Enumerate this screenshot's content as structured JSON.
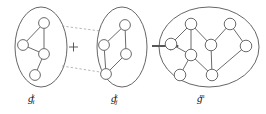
{
  "figure": {
    "type": "diagram",
    "background_color": "#ffffff",
    "node_fill": "#ffffff",
    "node_stroke": "#6b6b6b",
    "edge_color": "#6b6b6b",
    "ellipse_stroke": "#555555",
    "dashed_line_color": "#9a9a9a",
    "arrow_color": "#1f1f1f",
    "operator_symbol": "+",
    "arrow_symbol": "→"
  },
  "panels": [
    {
      "id": "left",
      "name": "graph-fragment-i",
      "label": {
        "base": "g",
        "sub": "i",
        "sup": "k",
        "text": "g_i^k"
      },
      "ellipse": {
        "cx": 41,
        "cy": 47,
        "rx": 26,
        "ry": 40
      },
      "nodes": [
        {
          "id": "L1",
          "cx": 44,
          "cy": 23,
          "r": 5.4
        },
        {
          "id": "L2",
          "cx": 23,
          "cy": 45,
          "r": 5.4
        },
        {
          "id": "L3",
          "cx": 44,
          "cy": 54,
          "r": 5.4
        },
        {
          "id": "L4",
          "cx": 35,
          "cy": 75,
          "r": 5.4
        }
      ],
      "edges": [
        {
          "from": "L1",
          "to": "L2"
        },
        {
          "from": "L1",
          "to": "L3"
        },
        {
          "from": "L2",
          "to": "L3"
        },
        {
          "from": "L3",
          "to": "L4"
        }
      ]
    },
    {
      "id": "middle",
      "name": "graph-fragment-j",
      "label": {
        "base": "g",
        "sub": "j",
        "sup": "k",
        "text": "g_j^k"
      },
      "ellipse": {
        "cx": 122,
        "cy": 47,
        "rx": 25,
        "ry": 40
      },
      "nodes": [
        {
          "id": "M1",
          "cx": 125,
          "cy": 25,
          "r": 5.4
        },
        {
          "id": "M2",
          "cx": 104,
          "cy": 45,
          "r": 5.4
        },
        {
          "id": "M3",
          "cx": 126,
          "cy": 54,
          "r": 5.4
        },
        {
          "id": "M4",
          "cx": 106,
          "cy": 74,
          "r": 5.4
        }
      ],
      "edges": [
        {
          "from": "M1",
          "to": "M2"
        },
        {
          "from": "M1",
          "to": "M3"
        },
        {
          "from": "M2",
          "to": "M4"
        },
        {
          "from": "M3",
          "to": "M4"
        }
      ]
    },
    {
      "id": "right",
      "name": "merged-graph",
      "label": {
        "base": "g",
        "sub": "",
        "sup": "m",
        "text": "g^m"
      },
      "ellipse": {
        "cx": 209,
        "cy": 47,
        "rx": 50,
        "ry": 40
      },
      "nodes": [
        {
          "id": "R1",
          "cx": 191,
          "cy": 24,
          "r": 5.8
        },
        {
          "id": "R2",
          "cx": 230,
          "cy": 24,
          "r": 5.8
        },
        {
          "id": "R3",
          "cx": 171,
          "cy": 44,
          "r": 5.8
        },
        {
          "id": "R4",
          "cx": 211,
          "cy": 45,
          "r": 5.8
        },
        {
          "id": "R5",
          "cx": 246,
          "cy": 46,
          "r": 5.8
        },
        {
          "id": "R6",
          "cx": 191,
          "cy": 55,
          "r": 5.8
        },
        {
          "id": "R7",
          "cx": 180,
          "cy": 75,
          "r": 5.8
        },
        {
          "id": "R8",
          "cx": 212,
          "cy": 75,
          "r": 5.8
        }
      ],
      "edges": [
        {
          "from": "R1",
          "to": "R3"
        },
        {
          "from": "R1",
          "to": "R6"
        },
        {
          "from": "R1",
          "to": "R4"
        },
        {
          "from": "R3",
          "to": "R6"
        },
        {
          "from": "R6",
          "to": "R7"
        },
        {
          "from": "R6",
          "to": "R8"
        },
        {
          "from": "R4",
          "to": "R8"
        },
        {
          "from": "R2",
          "to": "R4"
        },
        {
          "from": "R2",
          "to": "R5"
        },
        {
          "from": "R5",
          "to": "R8"
        }
      ]
    }
  ],
  "connectors": {
    "plus": {
      "x": 73,
      "y": 47,
      "size": 5,
      "label": "+"
    },
    "dashed_lines": [
      {
        "x1": 62,
        "y1": 26,
        "x2": 100,
        "y2": 31
      },
      {
        "x1": 62,
        "y1": 66,
        "x2": 100,
        "y2": 72
      }
    ],
    "arrow": {
      "x1": 152,
      "y1": 46,
      "x2": 176,
      "y2": 46
    }
  }
}
